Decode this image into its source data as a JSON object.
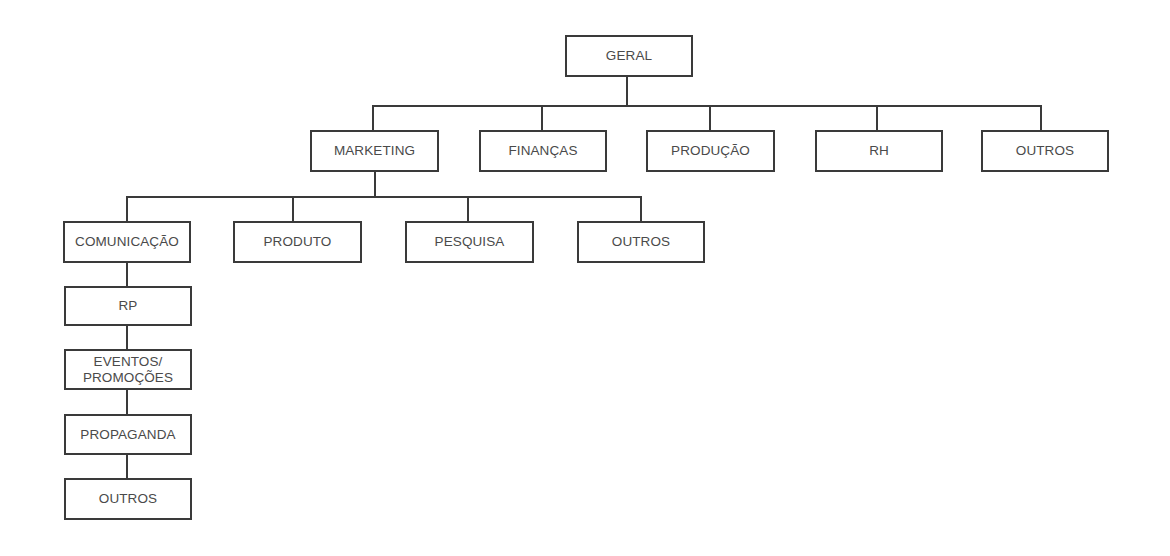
{
  "diagram": {
    "type": "org-chart",
    "root": {
      "label": "GERAL"
    },
    "level2": [
      {
        "label": "MARKETING"
      },
      {
        "label": "FINANÇAS"
      },
      {
        "label": "PRODUÇÃO"
      },
      {
        "label": "RH"
      },
      {
        "label": "OUTROS"
      }
    ],
    "marketing_children": [
      {
        "label": "COMUNICAÇÃO"
      },
      {
        "label": "PRODUTO"
      },
      {
        "label": "PESQUISA"
      },
      {
        "label": "OUTROS"
      }
    ],
    "comunicacao_chain": [
      {
        "label": "RP"
      },
      {
        "label": "EVENTOS/\nPROMOÇÕES",
        "line1": "EVENTOS/",
        "line2": "PROMOÇÕES"
      },
      {
        "label": "PROPAGANDA"
      },
      {
        "label": "OUTROS"
      }
    ],
    "colors": {
      "line": "#3a3a3a",
      "text": "#4a4a4a",
      "background": "#ffffff"
    }
  }
}
